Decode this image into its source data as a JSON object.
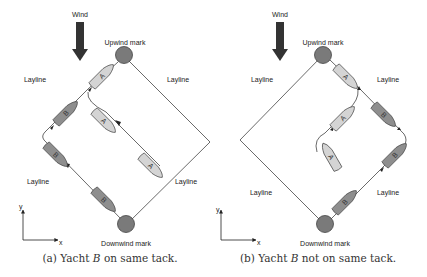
{
  "colors": {
    "mark_fill": "#7a7a7a",
    "boat_a_fill": "#d4d4d4",
    "boat_b_fill": "#8e8e8e",
    "arrow_fill": "#333333",
    "line": "#444444"
  },
  "panels": [
    {
      "id": "a",
      "wind_label": "Wind",
      "upwind_label": "Upwind mark",
      "downwind_label": "Downwind mark",
      "laylines": [
        "Layline",
        "Layline",
        "Layline",
        "Layline"
      ],
      "axes": {
        "x": "x",
        "y": "y"
      },
      "boats": [
        "A",
        "A",
        "A",
        "B",
        "B",
        "B"
      ],
      "caption_prefix": "(a) Yacht ",
      "caption_var": "B",
      "caption_suffix": " on same tack."
    },
    {
      "id": "b",
      "wind_label": "Wind",
      "upwind_label": "Upwind mark",
      "downwind_label": "Downwind mark",
      "laylines": [
        "Layline",
        "Layline",
        "Layline",
        "Layline"
      ],
      "axes": {
        "x": "x",
        "y": "y"
      },
      "boats": [
        "A",
        "A",
        "A",
        "B",
        "B",
        "B"
      ],
      "caption_prefix": "(b) Yacht ",
      "caption_var": "B",
      "caption_suffix": " not on same tack."
    }
  ]
}
